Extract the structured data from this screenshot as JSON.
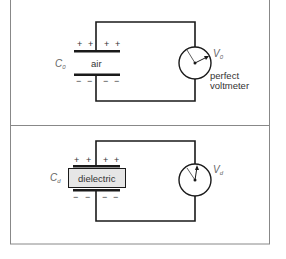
{
  "panels": [
    {
      "capacitor_label": "C",
      "capacitor_subscript": "0",
      "medium_label": "air",
      "voltage_label": "V",
      "voltage_subscript": "0",
      "meter_label_line1": "perfect",
      "meter_label_line2": "voltmeter",
      "top_plate_charges": [
        "+",
        "+",
        "+",
        "+"
      ],
      "bottom_plate_charges": [
        "−",
        "−",
        "−",
        "−"
      ]
    },
    {
      "capacitor_label": "C",
      "capacitor_subscript": "d",
      "medium_label": "dielectric",
      "voltage_label": "V",
      "voltage_subscript": "d",
      "top_plate_charges": [
        "+",
        "+",
        "+",
        "+"
      ],
      "bottom_plate_charges": [
        "−",
        "−",
        "−",
        "−"
      ]
    }
  ],
  "colors": {
    "line": "#1a1a1a",
    "frame": "#888888",
    "text": "#333333",
    "dielectric_fill": "#e6e6e6"
  }
}
